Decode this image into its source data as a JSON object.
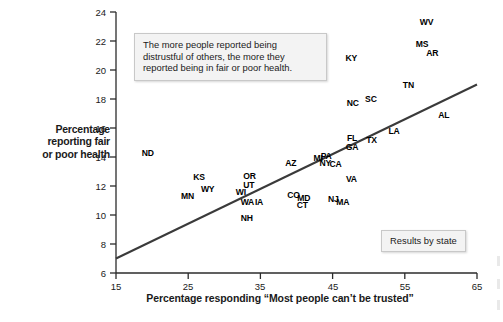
{
  "chart_data": {
    "type": "scatter",
    "title": "",
    "xlabel": "Percentage responding “Most people can’t be trusted”",
    "ylabel": "Percentage reporting fair or poor health",
    "xlim": [
      15,
      65
    ],
    "ylim": [
      6,
      24
    ],
    "xticks": [
      15,
      25,
      35,
      45,
      55,
      65
    ],
    "yticks": [
      6,
      8,
      10,
      12,
      14,
      16,
      18,
      20,
      22,
      24
    ],
    "grid": false,
    "legend_position": "inside-bottom-right",
    "legend_label": "Results by state",
    "annotation": "The more people reported being distrustful of others, the more they reported being in fair or poor health.",
    "point_style": "text-labels",
    "trendline": {
      "type": "linear",
      "x": [
        15,
        65
      ],
      "y": [
        7.0,
        19.0
      ]
    },
    "points": [
      {
        "label": "ND",
        "x": 19.4,
        "y": 14.3
      },
      {
        "label": "MN",
        "x": 24.9,
        "y": 11.3
      },
      {
        "label": "KS",
        "x": 26.5,
        "y": 12.6
      },
      {
        "label": "WY",
        "x": 27.7,
        "y": 11.8
      },
      {
        "label": "WI",
        "x": 32.3,
        "y": 11.6
      },
      {
        "label": "UT",
        "x": 33.4,
        "y": 12.1
      },
      {
        "label": "OR",
        "x": 33.5,
        "y": 12.7
      },
      {
        "label": "WA",
        "x": 33.2,
        "y": 10.9
      },
      {
        "label": "IA",
        "x": 34.8,
        "y": 10.9
      },
      {
        "label": "NH",
        "x": 33.1,
        "y": 9.8
      },
      {
        "label": "AZ",
        "x": 39.2,
        "y": 13.6
      },
      {
        "label": "CO",
        "x": 39.6,
        "y": 11.4
      },
      {
        "label": "MD",
        "x": 41.0,
        "y": 11.2
      },
      {
        "label": "CT",
        "x": 40.8,
        "y": 10.7
      },
      {
        "label": "MI",
        "x": 43.0,
        "y": 13.9
      },
      {
        "label": "PA",
        "x": 44.1,
        "y": 14.1
      },
      {
        "label": "NY",
        "x": 44.0,
        "y": 13.6
      },
      {
        "label": "CA",
        "x": 45.4,
        "y": 13.5
      },
      {
        "label": "NJ",
        "x": 45.1,
        "y": 11.1
      },
      {
        "label": "MA",
        "x": 46.4,
        "y": 10.9
      },
      {
        "label": "FL",
        "x": 47.7,
        "y": 15.3
      },
      {
        "label": "GA",
        "x": 47.7,
        "y": 14.7
      },
      {
        "label": "VA",
        "x": 47.6,
        "y": 12.5
      },
      {
        "label": "KY",
        "x": 47.6,
        "y": 20.8
      },
      {
        "label": "NC",
        "x": 47.8,
        "y": 17.7
      },
      {
        "label": "SC",
        "x": 50.3,
        "y": 18.0
      },
      {
        "label": "TX",
        "x": 50.4,
        "y": 15.2
      },
      {
        "label": "LA",
        "x": 53.5,
        "y": 15.8
      },
      {
        "label": "TN",
        "x": 55.5,
        "y": 19.0
      },
      {
        "label": "MS",
        "x": 57.4,
        "y": 21.8
      },
      {
        "label": "WV",
        "x": 58.0,
        "y": 23.3
      },
      {
        "label": "AR",
        "x": 58.8,
        "y": 21.2
      },
      {
        "label": "AL",
        "x": 60.4,
        "y": 16.9
      }
    ]
  },
  "axes": {
    "y_title_lines": [
      "Percentage",
      "reporting fair",
      "or poor health"
    ],
    "x_title": "Percentage responding “Most people can’t be trusted”",
    "x_tick_labels": [
      "15",
      "25",
      "35",
      "45",
      "55",
      "65"
    ],
    "y_tick_labels": [
      "24",
      "22",
      "20",
      "18",
      "16",
      "14",
      "12",
      "10",
      "8",
      "6"
    ]
  },
  "callouts": {
    "annotation_lines": [
      "The more people reported being",
      "distrustful of others, the more they",
      "reported being in fair or poor health."
    ],
    "legend_label": "Results by state"
  },
  "colors": {
    "axis": "#2b2b2b",
    "trendline": "#3a3a3a",
    "text": "#1a1a1a",
    "callout_bg": "#f3f3f3",
    "callout_border": "#c8c8c8"
  }
}
